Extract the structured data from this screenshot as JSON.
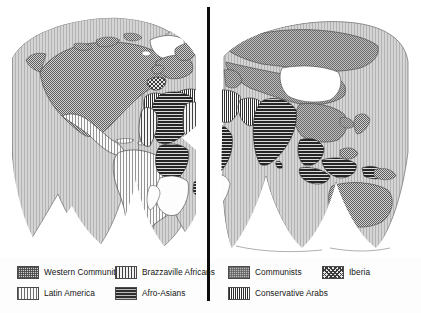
{
  "figure": {
    "type": "thematic-world-map",
    "projection": "interrupted homolosine (Goode)",
    "hemispheres": [
      "western-hemisphere",
      "eastern-hemisphere"
    ],
    "divider": "vertical-black-rule"
  },
  "legend": {
    "columns": [
      {
        "id": "legend-column-1",
        "items": [
          {
            "id": "western-community",
            "label": "Western Community",
            "pattern": "dotted-stipple",
            "color": "#cfcfcf"
          },
          {
            "id": "latin-america",
            "label": "Latin America",
            "pattern": "light-vertical-stripes",
            "color": "#fafafa"
          }
        ]
      },
      {
        "id": "legend-column-2",
        "items": [
          {
            "id": "brazzaville-africans",
            "label": "Brazzaville Africans",
            "pattern": "vertical-stripes",
            "color": "#f2f2f2"
          },
          {
            "id": "afro-asians",
            "label": "Afro-Asians",
            "pattern": "dark-horizontal-stripes",
            "color": "#2d2d2d"
          }
        ]
      },
      {
        "id": "legend-column-3",
        "items": [
          {
            "id": "communists",
            "label": "Communists",
            "pattern": "grey-stipple",
            "color": "#b9b9b9"
          },
          {
            "id": "conservative-arabs",
            "label": "Conservative Arabs",
            "pattern": "dense-vertical-stripes",
            "color": "#ffffff"
          }
        ]
      },
      {
        "id": "legend-column-4",
        "items": [
          {
            "id": "iberia",
            "label": "Iberia",
            "pattern": "cross-hatch",
            "color": "#e9e9e9"
          }
        ]
      }
    ]
  },
  "colors": {
    "divider": "#0d0d0d",
    "ocean": "#ffffff",
    "coastline": "#555555",
    "page": "#fdfdfd"
  }
}
